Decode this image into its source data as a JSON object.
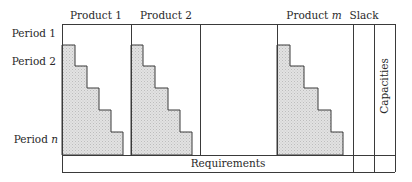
{
  "columns": [
    {
      "label": "Product 1",
      "var": ""
    },
    {
      "label": "Product 2",
      "var": ""
    },
    {
      "label": "Product ",
      "var": "m"
    },
    {
      "label": "Slack",
      "var": ""
    }
  ],
  "rows": [
    {
      "label": "Period 1",
      "var": ""
    },
    {
      "label": "Period 2",
      "var": ""
    },
    {
      "label": "Period ",
      "var": "n"
    }
  ],
  "bottom_row_label": "Requirements",
  "right_column_label": "Capacities",
  "colors": {
    "line": "#3a3a3a",
    "shade": "#d9d9d9",
    "text": "#2a2a2a",
    "background": "#ffffff"
  }
}
